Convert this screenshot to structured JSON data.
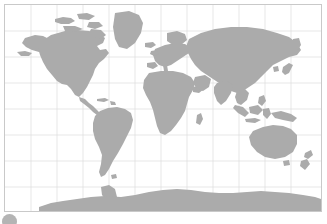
{
  "figure": {
    "kind": "world-map",
    "projection": "Mercator",
    "background_color": "#ffffff",
    "border_color": "#c9c9c9",
    "land_color": "#ababab",
    "graticule_color": "#dcdcdc",
    "badge_color": "#b4b4b4",
    "badge_name": "corner-badge"
  },
  "graticule": {
    "visible": true,
    "spacing_px": 26,
    "meridians_x": [
      5,
      31,
      57,
      83,
      109,
      135,
      161,
      187,
      213,
      239,
      265,
      291,
      317
    ],
    "parallels_y": [
      5,
      31,
      57,
      83,
      109,
      135,
      161,
      187,
      211
    ],
    "lon_labels": [
      "-180",
      "-150",
      "-120",
      "-90",
      "-60",
      "-30",
      "0",
      "30",
      "60",
      "90",
      "120",
      "150",
      "180"
    ],
    "lat_labels": [
      "80",
      "60",
      "40",
      "20",
      "0",
      "-20",
      "-40",
      "-60",
      "-80"
    ]
  },
  "landmasses": [
    {
      "name": "north-america",
      "label": "North America"
    },
    {
      "name": "greenland",
      "label": "Greenland"
    },
    {
      "name": "canadian-arctic",
      "label": "Canadian Arctic Archipelago"
    },
    {
      "name": "central-america",
      "label": "Central America"
    },
    {
      "name": "south-america",
      "label": "South America"
    },
    {
      "name": "europe",
      "label": "Europe"
    },
    {
      "name": "africa",
      "label": "Africa"
    },
    {
      "name": "madagascar",
      "label": "Madagascar"
    },
    {
      "name": "asia",
      "label": "Asia"
    },
    {
      "name": "japan",
      "label": "Japan"
    },
    {
      "name": "indonesia",
      "label": "Indonesia"
    },
    {
      "name": "new-guinea",
      "label": "New Guinea"
    },
    {
      "name": "australia",
      "label": "Australia"
    },
    {
      "name": "new-zealand",
      "label": "New Zealand"
    },
    {
      "name": "antarctica",
      "label": "Antarctica"
    },
    {
      "name": "british-isles",
      "label": "British Isles"
    },
    {
      "name": "iceland",
      "label": "Iceland"
    },
    {
      "name": "caribbean",
      "label": "Caribbean Islands"
    }
  ]
}
